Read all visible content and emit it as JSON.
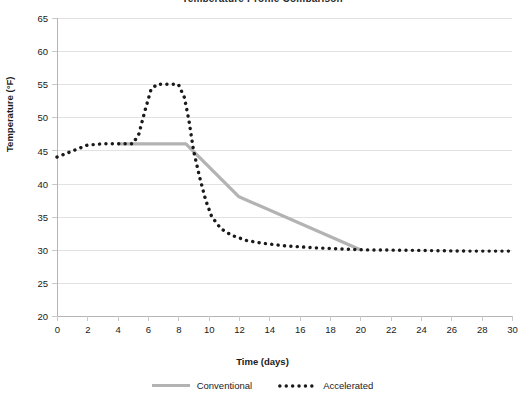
{
  "chart_data": {
    "type": "line",
    "title": "Temperature Profile Comparison",
    "xlabel": "Time (days)",
    "ylabel": "Temperature (°F)",
    "xlim": [
      0,
      30
    ],
    "ylim": [
      20,
      65
    ],
    "xticks": [
      0,
      2,
      4,
      6,
      8,
      10,
      12,
      14,
      16,
      18,
      20,
      22,
      24,
      26,
      28,
      30
    ],
    "yticks": [
      20,
      25,
      30,
      35,
      40,
      45,
      50,
      55,
      60,
      65
    ],
    "grid": "horizontal",
    "legend_position": "bottom",
    "series": [
      {
        "name": "Conventional",
        "style": "solid",
        "color": "#b3b3b3",
        "x": [
          4.0,
          8.5,
          12.0,
          20.0
        ],
        "values": [
          46.0,
          46.0,
          38.0,
          30.0
        ]
      },
      {
        "name": "Accelerated",
        "style": "dotted",
        "color": "#1a1a1a",
        "x": [
          0.0,
          1.0,
          2.0,
          3.0,
          4.0,
          5.0,
          5.4,
          5.8,
          6.2,
          6.6,
          7.0,
          8.0,
          8.4,
          8.7,
          9.0,
          9.4,
          9.8,
          10.2,
          10.8,
          11.5,
          12.5,
          13.5,
          15.0,
          17.0,
          20.0,
          24.0,
          27.0,
          30.0
        ],
        "values": [
          44.0,
          44.9,
          45.8,
          46.0,
          46.0,
          46.0,
          47.5,
          51.0,
          54.2,
          55.0,
          55.0,
          55.0,
          53.0,
          49.5,
          45.0,
          41.0,
          37.5,
          35.0,
          33.2,
          32.2,
          31.4,
          31.0,
          30.6,
          30.3,
          30.0,
          29.9,
          29.8,
          29.8
        ]
      }
    ]
  },
  "axes": {
    "y_title": "Temperature (°F)",
    "x_title": "Time (days)"
  },
  "legend": {
    "entries": [
      {
        "label": "Conventional"
      },
      {
        "label": "Accelerated"
      }
    ]
  }
}
